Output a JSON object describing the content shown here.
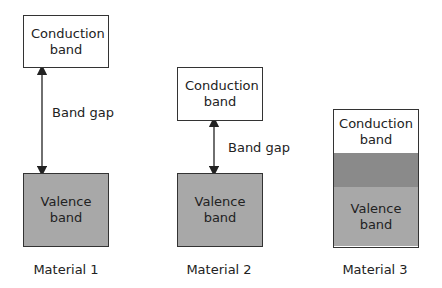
{
  "diagram": {
    "materials": [
      {
        "name": "Material 1",
        "conduction_band": "Conduction band",
        "valence_band": "Valence band",
        "band_gap_label": "Band gap",
        "gap_size": "large"
      },
      {
        "name": "Material 2",
        "conduction_band": "Conduction band",
        "valence_band": "Valence band",
        "band_gap_label": "Band gap",
        "gap_size": "small"
      },
      {
        "name": "Material 3",
        "conduction_band": "Conduction band",
        "valence_band": "Valence band",
        "gap_size": "overlap"
      }
    ],
    "colors": {
      "conduction": "#ffffff",
      "valence": "#a8a8a8",
      "overlap": "#8a8a8a",
      "stroke": "#333333"
    }
  }
}
